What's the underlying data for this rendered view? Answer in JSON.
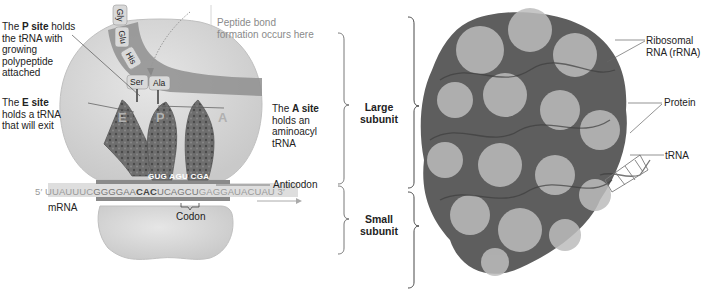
{
  "diagram": {
    "left_panel": {
      "labels": {
        "p_site": {
          "prefix": "The ",
          "bold": "P site",
          "rest": " holds the tRNA with growing polypeptide attached",
          "lines": [
            "the tRNA with",
            "growing",
            "polypeptide",
            "attached"
          ]
        },
        "e_site": {
          "prefix": "The ",
          "bold": "E site",
          "lines": [
            "holds a tRNA",
            "that will exit"
          ]
        },
        "a_site": {
          "prefix": "The ",
          "bold": "A site",
          "lines": [
            "holds an",
            "aminoacyl",
            "tRNA"
          ]
        },
        "peptide_bond": {
          "lines": [
            "Peptide bond",
            "formation occurs here"
          ]
        },
        "anticodon": "Anticodon",
        "codon": "Codon",
        "mrna": "mRNA"
      },
      "site_letters": [
        "E",
        "P",
        "A"
      ],
      "amino_acids": [
        "Gly",
        "Glu",
        "His",
        "Ser",
        "Ala"
      ],
      "anticodon_sequence": "GUG AGU CGA",
      "mrna_sequence": {
        "five_prime": "5′",
        "pre": "UUAUUUC",
        "hl1": "GGGGAA",
        "bold": "CAC",
        "hl2": "UCAGCU",
        "post": "GAGGAUACUAU",
        "three_prime": "3′"
      }
    },
    "middle_panel": {
      "large_subunit": [
        "Large",
        "subunit"
      ],
      "small_subunit": [
        "Small",
        "subunit"
      ]
    },
    "right_panel": {
      "labels": {
        "rrna": [
          "Ribosomal",
          "RNA (rRNA)"
        ],
        "protein": "Protein",
        "trna": "tRNA"
      }
    },
    "colors": {
      "ribosome_body": "#dcdcdc",
      "ribosome_edge": "#bdbdbd",
      "channel": "#8f8f8f",
      "trna": "#6e6e6e",
      "text": "#222222",
      "gray_text": "#8a8a8a"
    }
  }
}
